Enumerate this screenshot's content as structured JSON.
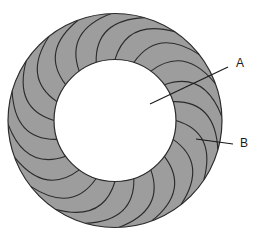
{
  "figure": {
    "background_color": "#ffffff",
    "ring": {
      "name": "annular-ring",
      "center": {
        "x": 115,
        "y": 120.5
      },
      "outer_radius": 107,
      "inner_radius": 61,
      "fill_color": "#9d9d9d",
      "stroke_color": "#2b2b2b",
      "stroke_width": 1.2
    },
    "vanes": {
      "name": "curved-vane-set",
      "count": 20,
      "stroke_color": "#2b2b2b",
      "stroke_width": 1.1,
      "sweep_degrees": 34,
      "description": "Curved radial divider lines spanning from inner circle to outer circle"
    },
    "callouts": [
      {
        "id": "callout-a",
        "label": "A",
        "label_x": 236,
        "label_y": 64,
        "leader_start_x": 150,
        "leader_start_y": 104,
        "leader_end_x": 228,
        "leader_end_y": 67,
        "points_to": "inner-circle-region",
        "stroke_color": "#1a1a1a"
      },
      {
        "id": "callout-b",
        "label": "B",
        "label_x": 240,
        "label_y": 144,
        "leader_start_x": 196,
        "leader_start_y": 139,
        "leader_end_x": 233,
        "leader_end_y": 144,
        "points_to": "ring-vane-region",
        "stroke_color": "#1a1a1a"
      }
    ]
  }
}
